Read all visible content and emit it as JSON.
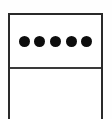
{
  "figure": {
    "canvas": {
      "width": 112,
      "height": 119,
      "background_color": "#fefefe"
    },
    "box": {
      "border_color": "#2a2a2a",
      "border_width": 2,
      "fill_color": "#ffffff",
      "left": 8,
      "top": 13,
      "right": 103,
      "bottom_open": true
    },
    "divider": {
      "orientation": "horizontal",
      "y": 67,
      "color": "#3a3a3a",
      "thickness": 2
    },
    "cells": [
      {
        "name": "dot-row-cell",
        "content": "five filled circles in a horizontal row",
        "text": ""
      },
      {
        "name": "empty-cell",
        "content": "empty",
        "text": ""
      }
    ],
    "dots": {
      "count": 5,
      "color": "#0d0d0d",
      "diameter": 11,
      "shape": "circle",
      "center_y": 44,
      "center_x": [
        20,
        39,
        57,
        76,
        95
      ],
      "labels": [
        "dot-1",
        "dot-2",
        "dot-3",
        "dot-4",
        "dot-5"
      ]
    }
  }
}
